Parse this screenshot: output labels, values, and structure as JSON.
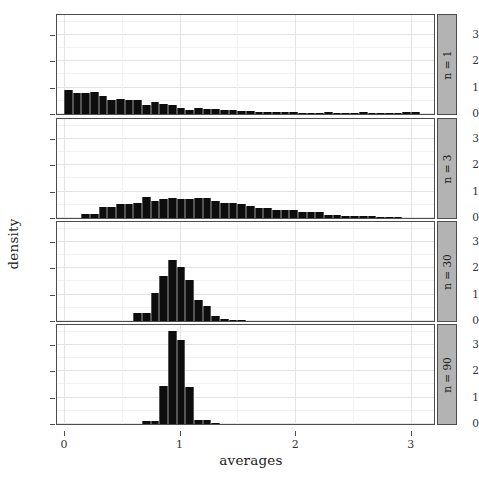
{
  "chart_data": {
    "type": "bar",
    "title": "",
    "subtitle": "",
    "xlabel": "averages",
    "ylabel": "density",
    "xlim": [
      -0.06,
      3.2
    ],
    "ylim": [
      0,
      3.75
    ],
    "xticks": [
      0,
      1,
      2,
      3
    ],
    "xtick_labels": [
      "0",
      "1",
      "2",
      "3"
    ],
    "yticks": [
      0,
      1,
      2,
      3
    ],
    "ytick_labels": [
      "0",
      "1",
      "2",
      "3"
    ],
    "grid": true,
    "legend": "none",
    "facet_variable": "n",
    "facet_position": "right",
    "bar_color": "#0d0d0d",
    "strip_color": "#b3b3b3",
    "panel_background": "#ffffff",
    "gridline_color": "#e3e3e3",
    "panels": [
      {
        "strip_label": "n = 1",
        "n": 1,
        "binwidth": 0.075,
        "bins": [
          {
            "x": 0.0375,
            "density": 0.9
          },
          {
            "x": 0.1125,
            "density": 0.81
          },
          {
            "x": 0.1875,
            "density": 0.78
          },
          {
            "x": 0.2625,
            "density": 0.84
          },
          {
            "x": 0.3375,
            "density": 0.67
          },
          {
            "x": 0.4125,
            "density": 0.52
          },
          {
            "x": 0.4875,
            "density": 0.56
          },
          {
            "x": 0.5625,
            "density": 0.52
          },
          {
            "x": 0.6375,
            "density": 0.52
          },
          {
            "x": 0.7125,
            "density": 0.33
          },
          {
            "x": 0.7875,
            "density": 0.46
          },
          {
            "x": 0.8625,
            "density": 0.38
          },
          {
            "x": 0.9375,
            "density": 0.34
          },
          {
            "x": 1.0125,
            "density": 0.22
          },
          {
            "x": 1.0875,
            "density": 0.15
          },
          {
            "x": 1.1625,
            "density": 0.21
          },
          {
            "x": 1.2375,
            "density": 0.19
          },
          {
            "x": 1.3125,
            "density": 0.19
          },
          {
            "x": 1.3875,
            "density": 0.15
          },
          {
            "x": 1.4625,
            "density": 0.15
          },
          {
            "x": 1.5375,
            "density": 0.11
          },
          {
            "x": 1.6125,
            "density": 0.13
          },
          {
            "x": 1.6875,
            "density": 0.08
          },
          {
            "x": 1.7625,
            "density": 0.08
          },
          {
            "x": 1.8375,
            "density": 0.07
          },
          {
            "x": 1.9125,
            "density": 0.07
          },
          {
            "x": 1.9875,
            "density": 0.06
          },
          {
            "x": 2.0625,
            "density": 0.05
          },
          {
            "x": 2.1375,
            "density": 0.05
          },
          {
            "x": 2.2125,
            "density": 0.04
          },
          {
            "x": 2.2875,
            "density": 0.06
          },
          {
            "x": 2.3625,
            "density": 0.03
          },
          {
            "x": 2.4375,
            "density": 0.03
          },
          {
            "x": 2.5125,
            "density": 0.03
          },
          {
            "x": 2.5875,
            "density": 0.06
          },
          {
            "x": 2.6625,
            "density": 0.02
          },
          {
            "x": 2.7375,
            "density": 0.02
          },
          {
            "x": 2.8125,
            "density": 0.02
          },
          {
            "x": 2.8875,
            "density": 0.01
          },
          {
            "x": 2.9625,
            "density": 0.06
          },
          {
            "x": 3.0375,
            "density": 0.06
          }
        ]
      },
      {
        "strip_label": "n = 3",
        "n": 3,
        "binwidth": 0.075,
        "bins": [
          {
            "x": 0.1875,
            "density": 0.17
          },
          {
            "x": 0.2625,
            "density": 0.17
          },
          {
            "x": 0.3375,
            "density": 0.42
          },
          {
            "x": 0.4125,
            "density": 0.41
          },
          {
            "x": 0.4875,
            "density": 0.52
          },
          {
            "x": 0.5625,
            "density": 0.52
          },
          {
            "x": 0.6375,
            "density": 0.57
          },
          {
            "x": 0.7125,
            "density": 0.81
          },
          {
            "x": 0.7875,
            "density": 0.66
          },
          {
            "x": 0.8625,
            "density": 0.72
          },
          {
            "x": 0.9375,
            "density": 0.75
          },
          {
            "x": 1.0125,
            "density": 0.73
          },
          {
            "x": 1.0875,
            "density": 0.73
          },
          {
            "x": 1.1625,
            "density": 0.75
          },
          {
            "x": 1.2375,
            "density": 0.75
          },
          {
            "x": 1.3125,
            "density": 0.65
          },
          {
            "x": 1.3875,
            "density": 0.56
          },
          {
            "x": 1.4625,
            "density": 0.55
          },
          {
            "x": 1.5375,
            "density": 0.54
          },
          {
            "x": 1.6125,
            "density": 0.46
          },
          {
            "x": 1.6875,
            "density": 0.39
          },
          {
            "x": 1.7625,
            "density": 0.37
          },
          {
            "x": 1.8375,
            "density": 0.3
          },
          {
            "x": 1.9125,
            "density": 0.31
          },
          {
            "x": 1.9875,
            "density": 0.31
          },
          {
            "x": 2.0625,
            "density": 0.21
          },
          {
            "x": 2.1375,
            "density": 0.23
          },
          {
            "x": 2.2125,
            "density": 0.23
          },
          {
            "x": 2.2875,
            "density": 0.1
          },
          {
            "x": 2.3625,
            "density": 0.1
          },
          {
            "x": 2.4375,
            "density": 0.09
          },
          {
            "x": 2.5125,
            "density": 0.09
          },
          {
            "x": 2.5875,
            "density": 0.08
          },
          {
            "x": 2.6625,
            "density": 0.08
          },
          {
            "x": 2.7375,
            "density": 0.03
          },
          {
            "x": 2.8125,
            "density": 0.04
          },
          {
            "x": 2.8875,
            "density": 0.03
          }
        ]
      },
      {
        "strip_label": "n = 30",
        "n": 30,
        "binwidth": 0.075,
        "bins": [
          {
            "x": 0.6375,
            "density": 0.3
          },
          {
            "x": 0.7125,
            "density": 0.3
          },
          {
            "x": 0.7875,
            "density": 1.05
          },
          {
            "x": 0.8625,
            "density": 1.72
          },
          {
            "x": 0.9375,
            "density": 2.3
          },
          {
            "x": 1.0125,
            "density": 2.05
          },
          {
            "x": 1.0875,
            "density": 1.55
          },
          {
            "x": 1.1625,
            "density": 0.8
          },
          {
            "x": 1.2375,
            "density": 0.55
          },
          {
            "x": 1.3125,
            "density": 0.2
          },
          {
            "x": 1.3875,
            "density": 0.08
          },
          {
            "x": 1.4625,
            "density": 0.05
          },
          {
            "x": 1.5375,
            "density": 0.04
          }
        ]
      },
      {
        "strip_label": "n = 90",
        "n": 90,
        "binwidth": 0.075,
        "bins": [
          {
            "x": 0.7125,
            "density": 0.12
          },
          {
            "x": 0.7875,
            "density": 0.12
          },
          {
            "x": 0.8625,
            "density": 1.45
          },
          {
            "x": 0.9375,
            "density": 3.52
          },
          {
            "x": 1.0125,
            "density": 3.2
          },
          {
            "x": 1.0875,
            "density": 1.4
          },
          {
            "x": 1.1625,
            "density": 0.16
          },
          {
            "x": 1.2375,
            "density": 0.16
          },
          {
            "x": 1.3125,
            "density": 0.05
          }
        ]
      }
    ]
  }
}
